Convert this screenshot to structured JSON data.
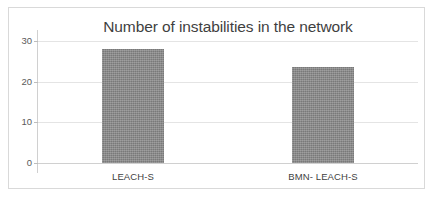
{
  "figure": {
    "border_color": "#d9d9d9",
    "background": "#ffffff"
  },
  "chart_data": {
    "type": "bar",
    "title": "Number of instabilities in the network",
    "xlabel": "",
    "ylabel": "",
    "categories": [
      "LEACH-S",
      "BMN- LEACH-S"
    ],
    "values": [
      28,
      23.5
    ],
    "ylim": [
      0,
      30
    ],
    "yticks": [
      0,
      10,
      20,
      30
    ],
    "ytick_labels": [
      "0",
      "10",
      "20",
      "30"
    ],
    "grid": true,
    "legend": null,
    "bar_color": "#848484",
    "title_color": "#3f3f3f",
    "gridline_color": "#e4e4e4",
    "axis_color": "#d0d0d0",
    "tick_label_color": "#5a5a5a"
  }
}
